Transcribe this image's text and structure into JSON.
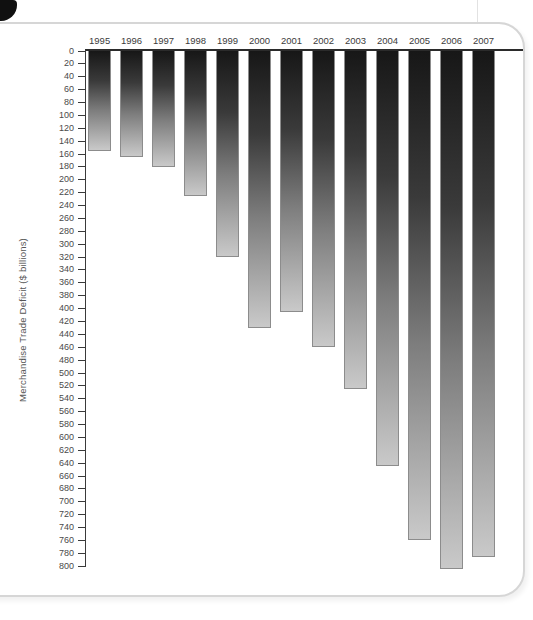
{
  "figure": {
    "panel_border_color": "#d6d6d6",
    "background_color": "#ffffff",
    "axis_color": "#2b2b2b",
    "tick_label_color": "#4a4a4a"
  },
  "chart_data": {
    "type": "bar",
    "title": "",
    "orientation": "vertical-downward-from-zero-at-top",
    "categories": [
      "1995",
      "1996",
      "1997",
      "1998",
      "1999",
      "2000",
      "2001",
      "2002",
      "2003",
      "2004",
      "2005",
      "2006",
      "2007"
    ],
    "values": [
      155,
      165,
      180,
      225,
      320,
      430,
      405,
      460,
      525,
      645,
      760,
      805,
      785
    ],
    "xlabel": "",
    "ylabel": "Merchandise Trade Deficit ($ billions)",
    "ylim": [
      0,
      800
    ],
    "ytick_step": 20,
    "grid": false,
    "legend": "none",
    "bar_style": {
      "gradient_top": "#171717",
      "gradient_bottom": "#c9c9c9",
      "border": "#8c8c8c"
    }
  }
}
